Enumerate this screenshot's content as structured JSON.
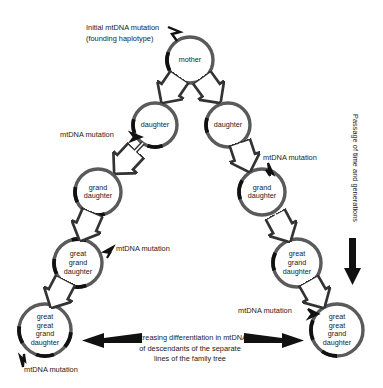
{
  "figure": {
    "background": "#ffffff",
    "ring_color": "#5a5a5a",
    "mutation_color": "#111111",
    "arrow_color": "#111111"
  },
  "cells": [
    {
      "id": "mother",
      "lines": [
        "mother"
      ],
      "cx": 190,
      "cy": 60,
      "r": 23,
      "mutations": [
        {
          "start": 243,
          "end": 290
        }
      ]
    },
    {
      "id": "daughter-left",
      "lines": [
        "daughter"
      ],
      "cx": 155,
      "cy": 125,
      "r": 22,
      "mutations": [
        {
          "start": 249,
          "end": 285
        },
        {
          "start": 160,
          "end": 200
        }
      ]
    },
    {
      "id": "daughter-right",
      "lines": [
        "daughter"
      ],
      "cx": 228,
      "cy": 125,
      "r": 22,
      "mutations": [
        {
          "start": 250,
          "end": 288
        }
      ]
    },
    {
      "id": "granddaughter-left",
      "lines": [
        "grand",
        "daughter"
      ],
      "cx": 98,
      "cy": 192,
      "r": 23,
      "mutations": [
        {
          "start": 244,
          "end": 282
        },
        {
          "start": 163,
          "end": 200
        }
      ]
    },
    {
      "id": "granddaughter-right",
      "lines": [
        "grand",
        "daughter"
      ],
      "cx": 262,
      "cy": 192,
      "r": 23,
      "mutations": [
        {
          "start": 252,
          "end": 300
        }
      ]
    },
    {
      "id": "greatgranddaughter-left",
      "lines": [
        "great",
        "grand",
        "daughter"
      ],
      "cx": 78,
      "cy": 263,
      "r": 24,
      "mutations": [
        {
          "start": 243,
          "end": 280
        },
        {
          "start": 160,
          "end": 198
        },
        {
          "start": 345,
          "end": 20
        }
      ]
    },
    {
      "id": "greatgranddaughter-right",
      "lines": [
        "great",
        "grand",
        "daughter"
      ],
      "cx": 297,
      "cy": 263,
      "r": 24,
      "mutations": [
        {
          "start": 252,
          "end": 295
        }
      ]
    },
    {
      "id": "greatgreatgranddaughter-left",
      "lines": [
        "great",
        "great",
        "grand",
        "daughter"
      ],
      "cx": 45,
      "cy": 330,
      "r": 26,
      "mutations": [
        {
          "start": 240,
          "end": 278
        },
        {
          "start": 160,
          "end": 200
        },
        {
          "start": 95,
          "end": 130
        }
      ]
    },
    {
      "id": "greatgreatgranddaughter-right",
      "lines": [
        "great",
        "great",
        "grand",
        "daughter"
      ],
      "cx": 337,
      "cy": 330,
      "r": 26,
      "mutations": [
        {
          "start": 248,
          "end": 292
        },
        {
          "start": 180,
          "end": 215
        }
      ]
    }
  ],
  "descent_arrows": [
    {
      "id": "mother-to-daughter-left",
      "x1": 178,
      "y1": 79,
      "x2": 163,
      "y2": 101
    },
    {
      "id": "mother-to-daughter-right",
      "x1": 203,
      "y1": 79,
      "x2": 219,
      "y2": 101
    },
    {
      "id": "daughter-left-to-grand",
      "x1": 143,
      "y1": 143,
      "x2": 116,
      "y2": 172
    },
    {
      "id": "daughter-right-to-grand",
      "x1": 240,
      "y1": 143,
      "x2": 249,
      "y2": 170
    },
    {
      "id": "grand-left-to-greatgrand",
      "x1": 91,
      "y1": 216,
      "x2": 81,
      "y2": 239
    },
    {
      "id": "grand-right-to-greatgrand",
      "x1": 275,
      "y1": 214,
      "x2": 289,
      "y2": 240
    },
    {
      "id": "greatgrand-left-to-gg",
      "x1": 63,
      "y1": 285,
      "x2": 52,
      "y2": 306
    },
    {
      "id": "greatgrand-right-to-gg",
      "x1": 311,
      "y1": 285,
      "x2": 323,
      "y2": 306
    }
  ],
  "annotations": {
    "initial_mutation": {
      "lines": [
        "Initial mtDNA mutation",
        "(founding haplotype)"
      ],
      "x": 86,
      "y": 30
    },
    "mutation_labels": [
      {
        "id": "mutation-daughter-left",
        "text": "mtDNA mutation",
        "x": 60,
        "y": 137,
        "anchor": "start"
      },
      {
        "id": "mutation-grand-right",
        "text": "mtDNA mutation",
        "x": 263,
        "y": 160,
        "anchor": "start"
      },
      {
        "id": "mutation-greatgrand-left",
        "text": "mtDNA mutation",
        "x": 116,
        "y": 251,
        "anchor": "start"
      },
      {
        "id": "mutation-gg-right",
        "text": "mtDNA mutation",
        "x": 238,
        "y": 313,
        "anchor": "start"
      },
      {
        "id": "mutation-gg-left",
        "text": "mtDNA mutation",
        "x": 24,
        "y": 372,
        "anchor": "start"
      }
    ],
    "passage_label": {
      "text": "Passage of time and generations",
      "x": 353,
      "y": 168
    },
    "differentiation": {
      "lines": [
        "Increasing differentiation in mtDNA",
        "of descendants of the separate",
        "lines of the family tree"
      ],
      "x": 190,
      "y": 340
    }
  }
}
